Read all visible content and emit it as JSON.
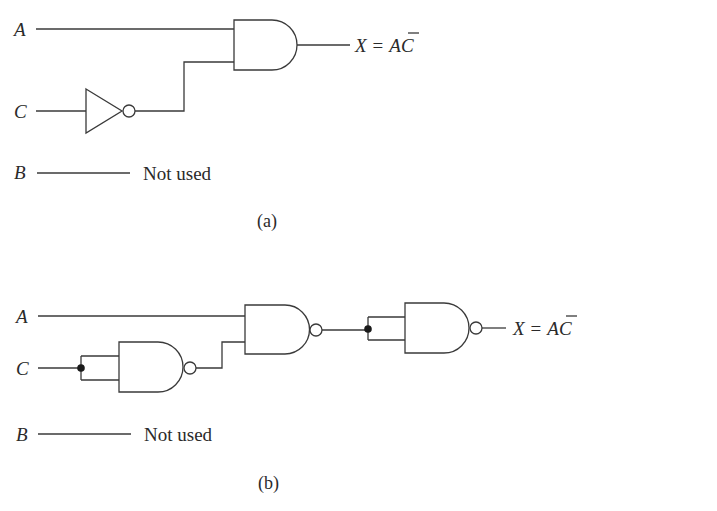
{
  "figure_a": {
    "caption": "(a)",
    "inputs": {
      "A": "A",
      "C": "C",
      "B": "B"
    },
    "unused_note": "Not used",
    "gates": [
      {
        "type": "NOT",
        "input": "C"
      },
      {
        "type": "AND",
        "inputs": [
          "A",
          "NOT C"
        ]
      }
    ],
    "output": {
      "lhs": "X",
      "eq": "=",
      "term_a": "A",
      "term_c": "C",
      "expression": "X = AC̅"
    }
  },
  "figure_b": {
    "caption": "(b)",
    "inputs": {
      "A": "A",
      "C": "C",
      "B": "B"
    },
    "unused_note": "Not used",
    "gates": [
      {
        "type": "NAND",
        "inputs": [
          "C",
          "C"
        ],
        "role": "inverter"
      },
      {
        "type": "NAND",
        "inputs": [
          "A",
          "NAND(C,C)"
        ]
      },
      {
        "type": "NAND",
        "inputs": [
          "tied",
          "tied"
        ],
        "role": "inverter"
      }
    ],
    "output": {
      "lhs": "X",
      "eq": "=",
      "term_a": "A",
      "term_c": "C",
      "expression": "X = AC̅"
    }
  }
}
